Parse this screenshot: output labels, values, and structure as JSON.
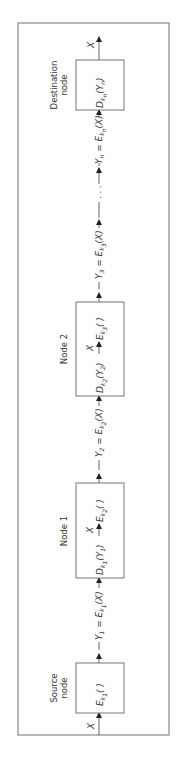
{
  "figure": {
    "orientation": "rotated-90-ccw",
    "flow_direction": "source-to-destination",
    "input_label": "X",
    "output_label": "X",
    "ellipsis": ". . .",
    "nodes": [
      {
        "id": "source",
        "title_line1": "Source",
        "title_line2": "node",
        "content": {
          "f": "E",
          "sub": "k",
          "subsub": "1",
          "rest": "(   )"
        }
      },
      {
        "id": "node1",
        "title": "Node 1",
        "decrypt": {
          "f": "D",
          "sub": "k",
          "subsub": "1",
          "arg_open": "(",
          "arg": "Y",
          "argsub": "1",
          "arg_close": ")"
        },
        "mid_label": "X",
        "encrypt": {
          "f": "E",
          "sub": "k",
          "subsub": "2",
          "rest": "(   )"
        }
      },
      {
        "id": "node2",
        "title": "Node 2",
        "decrypt": {
          "f": "D",
          "sub": "k",
          "subsub": "2",
          "arg_open": "(",
          "arg": "Y",
          "argsub": "2",
          "arg_close": ")"
        },
        "mid_label": "X",
        "encrypt": {
          "f": "E",
          "sub": "k",
          "subsub": "3",
          "rest": "(   )"
        }
      },
      {
        "id": "destination",
        "title_line1": "Destination",
        "title_line2": "node",
        "decrypt": {
          "f": "D",
          "sub": "k",
          "subsub": "n",
          "arg_open": "(",
          "arg": "Y",
          "argsub": "n",
          "arg_close": ")"
        }
      }
    ],
    "links": [
      {
        "lhs": "Y",
        "lhs_sub": "1",
        "eq": " = ",
        "f": "E",
        "sub": "k",
        "subsub": "1",
        "rest": "(X)"
      },
      {
        "lhs": "Y",
        "lhs_sub": "2",
        "eq": " = ",
        "f": "E",
        "sub": "k",
        "subsub": "2",
        "rest": "(X)"
      },
      {
        "lhs": "Y",
        "lhs_sub": "3",
        "eq": " = ",
        "f": "E",
        "sub": "k",
        "subsub": "3",
        "rest": "(X)"
      },
      {
        "lhs": "Y",
        "lhs_sub": "n",
        "eq": " = ",
        "f": "E",
        "sub": "k",
        "subsub": "n",
        "rest": "(X)"
      }
    ]
  },
  "colors": {
    "line": "#555555",
    "border": "#888888",
    "text": "#333333"
  }
}
